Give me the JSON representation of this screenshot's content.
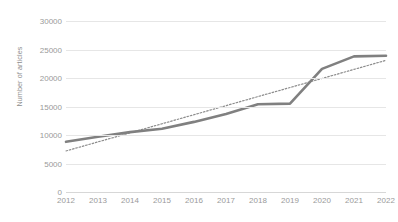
{
  "chart_data": {
    "type": "line",
    "title": "",
    "xlabel": "",
    "ylabel": "Number of articles",
    "categories": [
      "2012",
      "2013",
      "2014",
      "2015",
      "2016",
      "2017",
      "2018",
      "2019",
      "2020",
      "2021",
      "2022"
    ],
    "ylim": [
      0,
      30000
    ],
    "ytick_labels": [
      "0",
      "5000",
      "10000",
      "15000",
      "20000",
      "25000",
      "30000"
    ],
    "ytick_values": [
      0,
      5000,
      10000,
      15000,
      20000,
      25000,
      30000
    ],
    "grid": true,
    "legend": "none",
    "series": [
      {
        "name": "Number of articles",
        "style": "solid",
        "color": "#808080",
        "values": [
          8800,
          9700,
          10500,
          11100,
          12300,
          13700,
          15400,
          15500,
          21600,
          23800,
          23900
        ]
      },
      {
        "name": "Linear trendline",
        "style": "dotted",
        "color": "#8c8c8c",
        "values": [
          7200,
          8790,
          10380,
          11970,
          13560,
          15150,
          16740,
          18330,
          19920,
          21510,
          23100
        ]
      }
    ],
    "colors": {
      "series_line": "#808080",
      "trendline": "#8c8c8c",
      "gridline": "#e6e6e6",
      "axis_text": "#9a9a9a",
      "background": "#ffffff"
    }
  }
}
